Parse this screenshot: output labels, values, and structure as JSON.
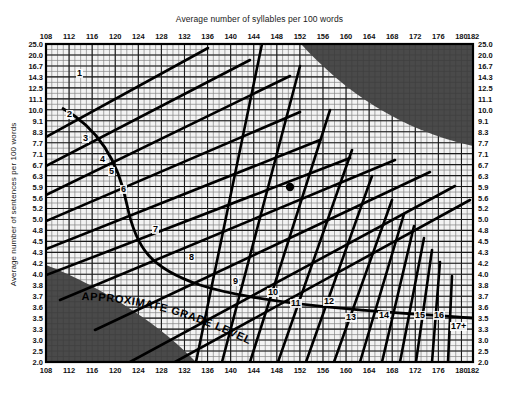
{
  "chart_data": {
    "type": "line",
    "xlabel": "Average number of syllables per 100 words",
    "ylabel": "Average number of sentences per 100 words",
    "xlim": [
      108,
      182
    ],
    "ylim": [
      2.0,
      25.0
    ],
    "grid": true,
    "legend": null,
    "x_ticks": [
      108,
      112,
      116,
      120,
      124,
      128,
      132,
      136,
      140,
      144,
      148,
      152,
      156,
      160,
      164,
      168,
      172,
      176,
      180,
      182
    ],
    "x_tick_labels": [
      "108",
      "112",
      "116",
      "120",
      "124",
      "128",
      "132",
      "136",
      "140",
      "144",
      "148",
      "152",
      "156",
      "160",
      "164",
      "168",
      "172",
      "176",
      "180",
      "182"
    ],
    "y_ticks": [
      25.0,
      20.0,
      16.7,
      14.3,
      12.5,
      11.1,
      10.0,
      9.1,
      8.3,
      7.7,
      7.1,
      6.7,
      6.3,
      5.9,
      5.6,
      5.2,
      5.0,
      4.8,
      4.5,
      4.3,
      4.2,
      4.0,
      3.8,
      3.7,
      3.6,
      3.5,
      3.3,
      3.0,
      2.5,
      2.0
    ],
    "y_tick_labels": [
      "25.0",
      "20.0",
      "16.7",
      "14.3",
      "12.5",
      "11.1",
      "10.0",
      "9.1",
      "8.3",
      "7.7",
      "7.1",
      "6.7",
      "6.3",
      "5.9",
      "5.6",
      "5.2",
      "5.0",
      "4.8",
      "4.5",
      "4.3",
      "4.2",
      "4.0",
      "3.8",
      "3.7",
      "3.6",
      "3.5",
      "3.3",
      "3.0",
      "2.5",
      "2.0"
    ],
    "grade_bands": [
      {
        "label": "1"
      },
      {
        "label": "2"
      },
      {
        "label": "3"
      },
      {
        "label": "4"
      },
      {
        "label": "5"
      },
      {
        "label": "6"
      },
      {
        "label": "7"
      },
      {
        "label": "8"
      },
      {
        "label": "9"
      },
      {
        "label": "10"
      },
      {
        "label": "11"
      },
      {
        "label": "12"
      },
      {
        "label": "13"
      },
      {
        "label": "14"
      },
      {
        "label": "15"
      },
      {
        "label": "16"
      },
      {
        "label": "17+"
      }
    ],
    "annotations": [
      {
        "text": "APPROXIMATE GRADE LEVEL",
        "kind": "curved-diagonal-label"
      }
    ],
    "data_points": [
      {
        "name": "sample-plot-point",
        "x": 151,
        "y": 6.3
      }
    ],
    "shaded_regions": [
      {
        "name": "invalid-region-top-right",
        "color": "#4a4a4a"
      },
      {
        "name": "invalid-region-bottom-left",
        "color": "#4a4a4a"
      }
    ],
    "colors": {
      "grid": "#888888",
      "axis": "#000000",
      "shaded": "#4a4a4a",
      "plot_background": "#f2f2f2",
      "point": "#000000"
    }
  },
  "axes": {
    "x_title": "Average number of syllables per 100 words",
    "y_title": "Average number of sentences per 100 words"
  },
  "annotation": {
    "grade_level_text": "APPROXIMATE GRADE LEVEL"
  }
}
